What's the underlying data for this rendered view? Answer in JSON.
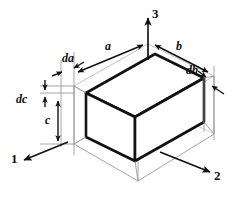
{
  "figure": {
    "type": "isometric-cube-diagram",
    "colors": {
      "ink": "#0f0f0f",
      "inner_edge": "#111111",
      "outer_edge": "#8d8d8d",
      "hidden_edge": "#bdbdbd",
      "background": "#ffffff"
    },
    "axes": [
      {
        "name": "axis-1",
        "label": "1",
        "direction": "lower-left"
      },
      {
        "name": "axis-2",
        "label": "2",
        "direction": "lower-right"
      },
      {
        "name": "axis-3",
        "label": "3",
        "direction": "up"
      }
    ],
    "dimensions": [
      {
        "name": "dim-a",
        "label": "a",
        "kind": "edge-length",
        "edge": "top-left-edge"
      },
      {
        "name": "dim-b",
        "label": "b",
        "kind": "edge-length",
        "edge": "top-right-edge"
      },
      {
        "name": "dim-c",
        "label": "c",
        "kind": "edge-length",
        "edge": "vertical-left-edge"
      },
      {
        "name": "dim-da",
        "label": "da",
        "kind": "differential",
        "edge": "axis-1-increment"
      },
      {
        "name": "dim-db",
        "label": "db",
        "kind": "differential",
        "edge": "axis-2-increment"
      },
      {
        "name": "dim-dc",
        "label": "dc",
        "kind": "differential",
        "edge": "axis-3-increment"
      }
    ]
  }
}
